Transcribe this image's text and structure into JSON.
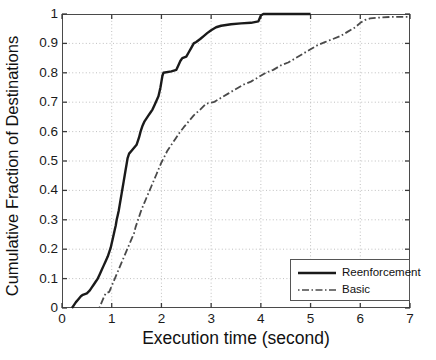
{
  "chart_data": {
    "type": "line",
    "title": "",
    "xlabel": "Execution time (second)",
    "ylabel": "Cumulative Fraction of Destinations",
    "xlim": [
      0,
      7
    ],
    "ylim": [
      0,
      1
    ],
    "xticks": [
      "0",
      "1",
      "2",
      "3",
      "4",
      "5",
      "6",
      "7"
    ],
    "yticks": [
      "0",
      "0.1",
      "0.2",
      "0.3",
      "0.4",
      "0.5",
      "0.6",
      "0.7",
      "0.8",
      "0.9",
      "1"
    ],
    "grid": true,
    "legend_position": "lower right",
    "series": [
      {
        "name": "Reenforcement",
        "style": "solid",
        "color": "#1a1a1a",
        "points": [
          [
            0.2,
            0.0
          ],
          [
            0.24,
            0.01
          ],
          [
            0.28,
            0.02
          ],
          [
            0.33,
            0.03
          ],
          [
            0.38,
            0.04
          ],
          [
            0.42,
            0.045
          ],
          [
            0.5,
            0.05
          ],
          [
            0.56,
            0.06
          ],
          [
            0.6,
            0.07
          ],
          [
            0.64,
            0.08
          ],
          [
            0.68,
            0.09
          ],
          [
            0.72,
            0.1
          ],
          [
            0.76,
            0.115
          ],
          [
            0.8,
            0.13
          ],
          [
            0.84,
            0.145
          ],
          [
            0.88,
            0.16
          ],
          [
            0.92,
            0.175
          ],
          [
            0.95,
            0.19
          ],
          [
            0.98,
            0.205
          ],
          [
            1.0,
            0.22
          ],
          [
            1.02,
            0.235
          ],
          [
            1.04,
            0.25
          ],
          [
            1.06,
            0.265
          ],
          [
            1.08,
            0.28
          ],
          [
            1.1,
            0.3
          ],
          [
            1.12,
            0.315
          ],
          [
            1.14,
            0.33
          ],
          [
            1.16,
            0.35
          ],
          [
            1.18,
            0.37
          ],
          [
            1.2,
            0.39
          ],
          [
            1.22,
            0.41
          ],
          [
            1.24,
            0.43
          ],
          [
            1.26,
            0.45
          ],
          [
            1.28,
            0.47
          ],
          [
            1.3,
            0.49
          ],
          [
            1.32,
            0.51
          ],
          [
            1.35,
            0.525
          ],
          [
            1.4,
            0.535
          ],
          [
            1.45,
            0.545
          ],
          [
            1.5,
            0.555
          ],
          [
            1.55,
            0.58
          ],
          [
            1.58,
            0.6
          ],
          [
            1.62,
            0.62
          ],
          [
            1.66,
            0.635
          ],
          [
            1.7,
            0.645
          ],
          [
            1.74,
            0.655
          ],
          [
            1.78,
            0.665
          ],
          [
            1.82,
            0.675
          ],
          [
            1.86,
            0.69
          ],
          [
            1.9,
            0.705
          ],
          [
            1.94,
            0.72
          ],
          [
            1.96,
            0.735
          ],
          [
            1.98,
            0.75
          ],
          [
            2.0,
            0.77
          ],
          [
            2.02,
            0.79
          ],
          [
            2.04,
            0.8
          ],
          [
            2.2,
            0.805
          ],
          [
            2.3,
            0.81
          ],
          [
            2.34,
            0.825
          ],
          [
            2.38,
            0.84
          ],
          [
            2.42,
            0.85
          ],
          [
            2.5,
            0.855
          ],
          [
            2.55,
            0.87
          ],
          [
            2.6,
            0.885
          ],
          [
            2.65,
            0.9
          ],
          [
            2.7,
            0.905
          ],
          [
            2.78,
            0.915
          ],
          [
            2.85,
            0.925
          ],
          [
            2.92,
            0.935
          ],
          [
            3.0,
            0.945
          ],
          [
            3.1,
            0.955
          ],
          [
            3.2,
            0.96
          ],
          [
            3.4,
            0.965
          ],
          [
            3.6,
            0.968
          ],
          [
            3.8,
            0.97
          ],
          [
            3.95,
            0.975
          ],
          [
            4.0,
            0.995
          ],
          [
            4.05,
            1.0
          ],
          [
            5.0,
            1.0
          ]
        ]
      },
      {
        "name": "Basic",
        "style": "dashdot",
        "color": "#4a4a4a",
        "points": [
          [
            0.75,
            0.0
          ],
          [
            0.8,
            0.02
          ],
          [
            0.85,
            0.04
          ],
          [
            0.88,
            0.05
          ],
          [
            0.95,
            0.055
          ],
          [
            1.0,
            0.075
          ],
          [
            1.05,
            0.095
          ],
          [
            1.1,
            0.115
          ],
          [
            1.15,
            0.135
          ],
          [
            1.2,
            0.155
          ],
          [
            1.25,
            0.175
          ],
          [
            1.3,
            0.195
          ],
          [
            1.35,
            0.215
          ],
          [
            1.4,
            0.235
          ],
          [
            1.45,
            0.255
          ],
          [
            1.48,
            0.275
          ],
          [
            1.52,
            0.295
          ],
          [
            1.56,
            0.315
          ],
          [
            1.6,
            0.335
          ],
          [
            1.65,
            0.355
          ],
          [
            1.7,
            0.375
          ],
          [
            1.75,
            0.395
          ],
          [
            1.8,
            0.415
          ],
          [
            1.85,
            0.435
          ],
          [
            1.9,
            0.455
          ],
          [
            1.95,
            0.475
          ],
          [
            2.0,
            0.495
          ],
          [
            2.06,
            0.515
          ],
          [
            2.12,
            0.535
          ],
          [
            2.2,
            0.555
          ],
          [
            2.28,
            0.575
          ],
          [
            2.36,
            0.595
          ],
          [
            2.45,
            0.615
          ],
          [
            2.55,
            0.635
          ],
          [
            2.65,
            0.655
          ],
          [
            2.78,
            0.675
          ],
          [
            2.9,
            0.695
          ],
          [
            3.05,
            0.7
          ],
          [
            3.2,
            0.715
          ],
          [
            3.35,
            0.73
          ],
          [
            3.5,
            0.745
          ],
          [
            3.65,
            0.76
          ],
          [
            3.8,
            0.77
          ],
          [
            3.95,
            0.785
          ],
          [
            4.1,
            0.8
          ],
          [
            4.25,
            0.81
          ],
          [
            4.4,
            0.825
          ],
          [
            4.55,
            0.835
          ],
          [
            4.7,
            0.85
          ],
          [
            4.85,
            0.865
          ],
          [
            5.0,
            0.88
          ],
          [
            5.15,
            0.895
          ],
          [
            5.3,
            0.905
          ],
          [
            5.45,
            0.915
          ],
          [
            5.6,
            0.925
          ],
          [
            5.75,
            0.94
          ],
          [
            5.9,
            0.955
          ],
          [
            6.0,
            0.97
          ],
          [
            6.1,
            0.98
          ],
          [
            6.2,
            0.985
          ],
          [
            6.4,
            0.988
          ],
          [
            6.6,
            0.99
          ],
          [
            6.8,
            0.99
          ],
          [
            7.0,
            0.99
          ]
        ]
      }
    ]
  },
  "legend": {
    "entries": [
      {
        "label": "Reenforcement"
      },
      {
        "label": "Basic"
      }
    ]
  }
}
